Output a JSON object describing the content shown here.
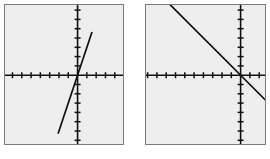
{
  "figure": {
    "title": "",
    "background_color": "#ffffff",
    "panel_fill": "#eeeeee",
    "panel_border_color": "#7b7b7b",
    "axis_color": "#111111",
    "curve_color": "#111111",
    "panel_count": 2
  },
  "chart_data": [
    {
      "type": "line",
      "title": "",
      "subtitle": "",
      "xlabel": "",
      "ylabel": "",
      "panel_label": "left-graph",
      "description": "Steep positive-slope straight line through the origin on a graphing-calculator style grid",
      "grid": false,
      "axes_style": "cross-hairs with evenly spaced tick marks",
      "xlim": [
        -8,
        5
      ],
      "ylim": [
        -5,
        5
      ],
      "x_tick_step": 1,
      "y_tick_step": 1,
      "origin_fraction": {
        "x": 0.615,
        "y": 0.505
      },
      "tick_spacing_px": {
        "x": 9.3,
        "y": 9.3
      },
      "series": [
        {
          "name": "y = 3x",
          "slope": 3,
          "intercept": 0,
          "x": [
            -2.1,
            1.55
          ],
          "y": [
            -6.3,
            4.65
          ]
        }
      ],
      "legend": [],
      "legend_position": "none",
      "annotations": []
    },
    {
      "type": "line",
      "title": "",
      "subtitle": "",
      "xlabel": "",
      "ylabel": "",
      "panel_label": "right-graph",
      "description": "Negative-slope straight line through the origin on a graphing-calculator style grid",
      "grid": false,
      "axes_style": "cross-hairs with evenly spaced tick marks",
      "xlim": [
        -10,
        3
      ],
      "ylim": [
        -5,
        5
      ],
      "x_tick_step": 1,
      "y_tick_step": 1,
      "origin_fraction": {
        "x": 0.795,
        "y": 0.505
      },
      "tick_spacing_px": {
        "x": 9.3,
        "y": 9.3
      },
      "series": [
        {
          "name": "y = -x",
          "slope": -1,
          "intercept": 0,
          "x": [
            -9.6,
            3.2
          ],
          "y": [
            9.6,
            -3.2
          ]
        }
      ],
      "legend": [],
      "legend_position": "none",
      "annotations": []
    }
  ],
  "panels": [
    {
      "name": "left-graph",
      "x": 4,
      "y": 4,
      "width": 120,
      "height": 141
    },
    {
      "name": "right-graph",
      "x": 145,
      "y": 4,
      "width": 121,
      "height": 141
    }
  ]
}
